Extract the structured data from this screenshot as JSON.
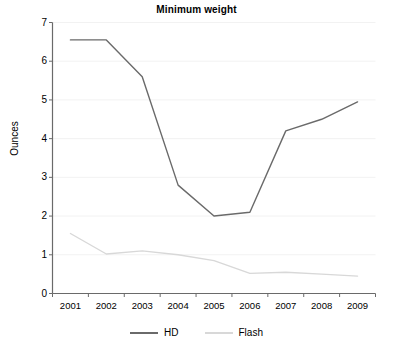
{
  "chart_data": {
    "type": "line",
    "title": "Minimum weight",
    "xlabel": "",
    "ylabel": "Ounces",
    "categories": [
      "2001",
      "2002",
      "2003",
      "2004",
      "2005",
      "2006",
      "2007",
      "2008",
      "2009"
    ],
    "x": [
      2001,
      2002,
      2003,
      2004,
      2005,
      2006,
      2007,
      2008,
      2009
    ],
    "series": [
      {
        "name": "HD",
        "color": "#6a6a6a",
        "values": [
          6.55,
          6.55,
          5.6,
          2.8,
          2.0,
          2.1,
          4.2,
          4.5,
          4.95
        ]
      },
      {
        "name": "Flash",
        "color": "#d8d8d8",
        "values": [
          1.55,
          1.02,
          1.1,
          1.0,
          0.85,
          0.52,
          0.55,
          0.5,
          0.45
        ]
      }
    ],
    "ylim": [
      0,
      7
    ],
    "yticks": [
      0,
      1,
      2,
      3,
      4,
      5,
      6,
      7
    ],
    "ytick_labels": [
      "0",
      "1",
      "2",
      "3",
      "4",
      "5",
      "6",
      "7"
    ],
    "grid": true,
    "grid_color": "#f2f2f2",
    "axis_color": "#6a6a6a",
    "background": "#ffffff",
    "legend_position": "bottom-center",
    "legend": [
      {
        "label": "HD",
        "color": "#6a6a6a"
      },
      {
        "label": "Flash",
        "color": "#d8d8d8"
      }
    ]
  }
}
